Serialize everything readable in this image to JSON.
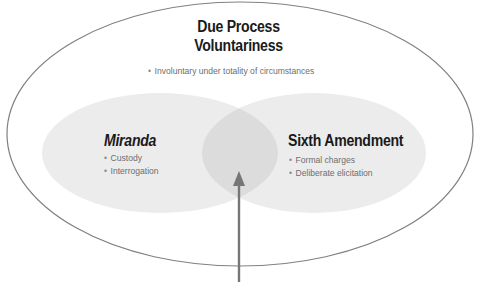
{
  "diagram": {
    "type": "venn",
    "colors": {
      "outer_stroke": "#808080",
      "inner_fill": "#ececec",
      "overlap_fill": "#dcdcdc",
      "arrow": "#767676",
      "title_text": "#1a1a1a",
      "bullet_text": "#6e6e6e"
    },
    "outer": {
      "title_line1": "Due Process",
      "title_line2": "Voluntariness",
      "bullets": [
        "Involuntary under totality of circumstances"
      ]
    },
    "left": {
      "title": "Miranda",
      "bullets": [
        "Custody",
        "Interrogation"
      ]
    },
    "right": {
      "title": "Sixth Amendment",
      "bullets": [
        "Formal charges",
        "Deliberate elicitation"
      ]
    },
    "overlap": {
      "pointer": "arrow-up"
    }
  }
}
